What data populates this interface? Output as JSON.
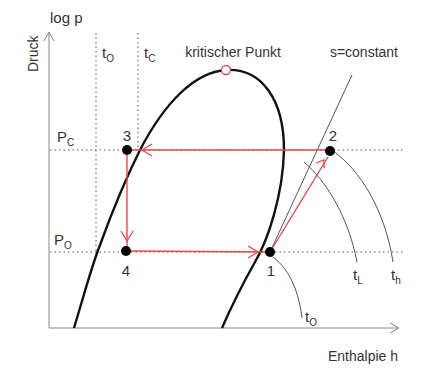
{
  "diagram": {
    "axes": {
      "y_label": "log p",
      "y_caption": "Druck",
      "x_label": "Enthalpie h"
    },
    "isotherms": {
      "t0_main": "t",
      "t0_sub": "O",
      "tc_main": "t",
      "tc_sub": "C"
    },
    "pressures": {
      "pc_main": "P",
      "pc_sub": "C",
      "po_main": "P",
      "po_sub": "O"
    },
    "critical_point_label": "kritischer Punkt",
    "isentrope_label": "s=constant",
    "points": [
      {
        "id": "1",
        "label": "1"
      },
      {
        "id": "2",
        "label": "2"
      },
      {
        "id": "3",
        "label": "3"
      },
      {
        "id": "4",
        "label": "4"
      }
    ],
    "curve_labels": {
      "tl_main": "t",
      "tl_sub": "L",
      "th_main": "t",
      "th_sub": "h",
      "t0_low_main": "t",
      "t0_low_sub": "O"
    },
    "colors": {
      "cycle": "#e8484a",
      "dome": "#111111",
      "text": "#333333"
    }
  }
}
